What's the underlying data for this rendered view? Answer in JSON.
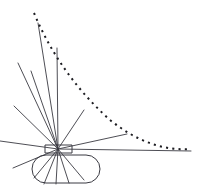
{
  "figure": {
    "canvas": {
      "width": 204,
      "height": 194,
      "background": "#ffffff"
    },
    "colors": {
      "stroke": "#3a3a42",
      "dotted_stroke": "#1d1d22",
      "background": "#ffffff"
    },
    "emitter": {
      "label": "emitter-block",
      "shape": "rectangle",
      "x": 45,
      "y": 145,
      "width": 27,
      "height": 8
    },
    "base": {
      "label": "base-capsule",
      "shape": "rounded-rectangle",
      "x": 32,
      "y": 155,
      "width": 68,
      "height": 28,
      "corner_radius": 14
    },
    "origin": {
      "x": 58,
      "y": 149
    },
    "rays": [
      {
        "name": "ray-up-steep-left",
        "x1": 58,
        "y1": 149,
        "x2": 38,
        "y2": 23
      },
      {
        "name": "ray-up-vertical",
        "x1": 58,
        "y1": 149,
        "x2": 57,
        "y2": 48
      },
      {
        "name": "ray-upper-left-a",
        "x1": 58,
        "y1": 149,
        "x2": 18,
        "y2": 63
      },
      {
        "name": "ray-upper-left-b",
        "x1": 58,
        "y1": 149,
        "x2": 31,
        "y2": 71
      },
      {
        "name": "ray-left-mid",
        "x1": 58,
        "y1": 149,
        "x2": 14,
        "y2": 106
      },
      {
        "name": "ray-left-horizontal",
        "x1": 58,
        "y1": 149,
        "x2": 0,
        "y2": 141
      },
      {
        "name": "ray-lower-left",
        "x1": 58,
        "y1": 149,
        "x2": 13,
        "y2": 168
      },
      {
        "name": "ray-upper-right",
        "x1": 58,
        "y1": 149,
        "x2": 84,
        "y2": 110
      },
      {
        "name": "ray-right-slight",
        "x1": 58,
        "y1": 149,
        "x2": 127,
        "y2": 134
      },
      {
        "name": "ray-right-long",
        "x1": 58,
        "y1": 149,
        "x2": 191,
        "y2": 151
      },
      {
        "name": "ray-down-right-a",
        "x1": 58,
        "y1": 149,
        "x2": 84,
        "y2": 180
      },
      {
        "name": "ray-down-right-b",
        "x1": 58,
        "y1": 149,
        "x2": 69,
        "y2": 183
      },
      {
        "name": "ray-down-center",
        "x1": 58,
        "y1": 149,
        "x2": 56,
        "y2": 184
      },
      {
        "name": "ray-down-left-a",
        "x1": 58,
        "y1": 149,
        "x2": 44,
        "y2": 184
      },
      {
        "name": "ray-down-left-b",
        "x1": 58,
        "y1": 149,
        "x2": 34,
        "y2": 178
      }
    ],
    "trajectory": {
      "name": "dotted-trajectory-curve",
      "style": "dotted",
      "path": "M 34 13 Q 60 75 110 120 Q 150 152 191 149",
      "start": {
        "x": 34,
        "y": 13
      },
      "end": {
        "x": 191,
        "y": 149
      }
    }
  }
}
